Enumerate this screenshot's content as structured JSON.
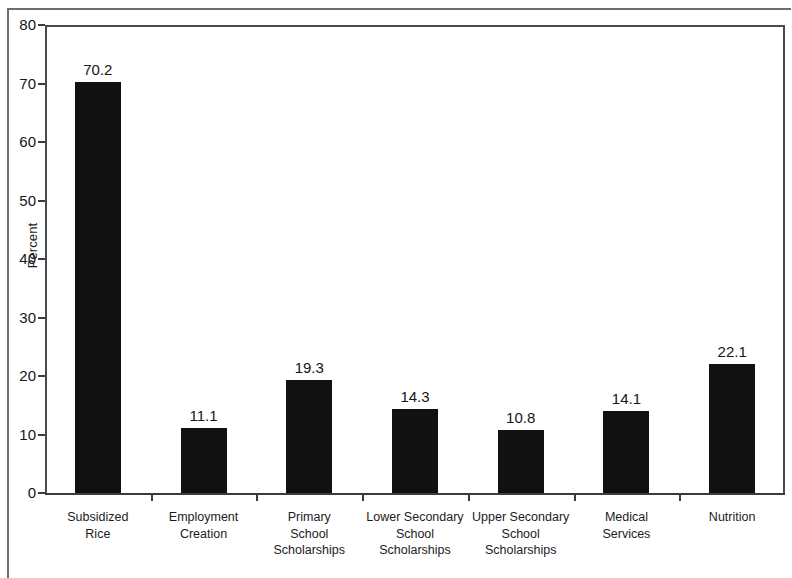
{
  "chart_data": {
    "type": "bar",
    "title": "",
    "subtitle": "",
    "xlabel": "",
    "ylabel": "Percent",
    "ylim": [
      0,
      80
    ],
    "ytick_labels": [
      "0",
      "10",
      "20",
      "30",
      "40",
      "50",
      "60",
      "70",
      "80"
    ],
    "ytick_values": [
      0,
      10,
      20,
      30,
      40,
      50,
      60,
      70,
      80
    ],
    "grid": false,
    "legend": false,
    "legend_position": "none",
    "bar_color": "#111111",
    "axis_color": "#3c3c3c",
    "background_color": "#ffffff",
    "categories": [
      "Subsidized\nRice",
      "Employment\nCreation",
      "Primary\nSchool\nScholarships",
      "Lower Secondary\nSchool\nScholarships",
      "Upper Secondary\nSchool\nScholarships",
      "Medical\nServices",
      "Nutrition"
    ],
    "values": [
      70.2,
      11.1,
      19.3,
      14.3,
      10.8,
      14.1,
      22.1
    ],
    "value_labels": [
      "70.2",
      "11.1",
      "19.3",
      "14.3",
      "10.8",
      "14.1",
      "22.1"
    ]
  }
}
